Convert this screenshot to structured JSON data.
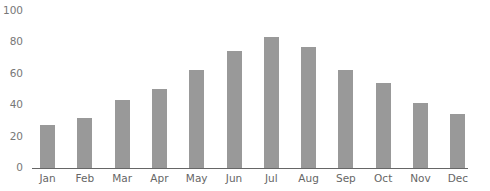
{
  "chart_data": {
    "type": "bar",
    "title": "",
    "xlabel": "",
    "ylabel": "",
    "categories": [
      "Jan",
      "Feb",
      "Mar",
      "Apr",
      "May",
      "Jun",
      "Jul",
      "Aug",
      "Sep",
      "Oct",
      "Nov",
      "Dec"
    ],
    "values": [
      27,
      32,
      43,
      50,
      62,
      74,
      83,
      77,
      62,
      54,
      41,
      34
    ],
    "ylim": [
      0,
      100
    ],
    "yticks": [
      0,
      20,
      40,
      60,
      80,
      100
    ],
    "grid": false,
    "legend": null,
    "bar_color": "#999999"
  }
}
